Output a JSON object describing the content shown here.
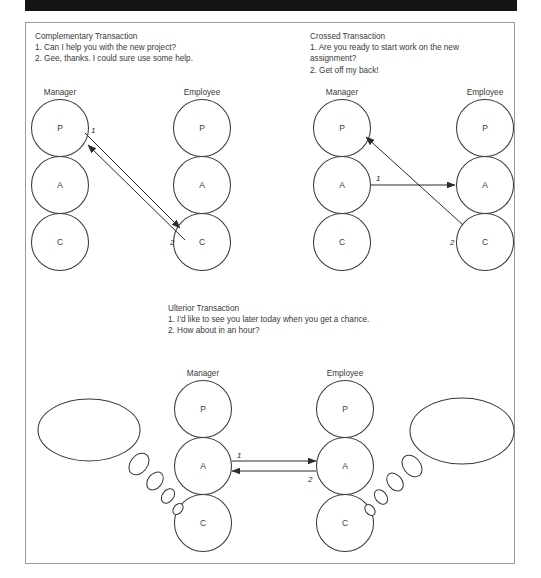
{
  "page": {
    "header_bar_color": "#151515",
    "frame_border_color": "#9a9a9a"
  },
  "panels": [
    {
      "id": "complementary",
      "title": "Complementary Transaction",
      "lines": "1. Can I help you with the new project?\n2. Gee, thanks. I could sure use some help.",
      "columns": [
        {
          "role": "Manager",
          "states": [
            "P",
            "A",
            "C"
          ]
        },
        {
          "role": "Employee",
          "states": [
            "P",
            "A",
            "C"
          ]
        }
      ],
      "arrows": [
        {
          "label": "1",
          "from": "manager-P",
          "to": "employee-C"
        },
        {
          "label": "2",
          "from": "employee-C",
          "to": "manager-P"
        }
      ]
    },
    {
      "id": "crossed",
      "title": "Crossed Transaction",
      "lines": "1. Are you ready to start work on the new\nassignment?\n2. Get off my back!",
      "columns": [
        {
          "role": "Manager",
          "states": [
            "P",
            "A",
            "C"
          ]
        },
        {
          "role": "Employee",
          "states": [
            "P",
            "A",
            "C"
          ]
        }
      ],
      "arrows": [
        {
          "label": "1",
          "from": "manager-A",
          "to": "employee-A"
        },
        {
          "label": "2",
          "from": "employee-C",
          "to": "manager-P"
        }
      ]
    },
    {
      "id": "ulterior",
      "title": "Ulterior Transaction",
      "lines": "1. I'd like to see you later today when you get a chance.\n2. How about in an hour?",
      "columns": [
        {
          "role": "Manager",
          "states": [
            "P",
            "A",
            "C"
          ]
        },
        {
          "role": "Employee",
          "states": [
            "P",
            "A",
            "C"
          ]
        }
      ],
      "arrows": [
        {
          "label": "1",
          "from": "manager-A",
          "to": "employee-A"
        },
        {
          "label": "2",
          "from": "employee-A",
          "to": "manager-A"
        }
      ],
      "thoughts": [
        {
          "id": "manager-thought",
          "text": "You idiot.\nNot again."
        },
        {
          "id": "employee-thought",
          "text": "He's always\non my back."
        }
      ]
    }
  ]
}
